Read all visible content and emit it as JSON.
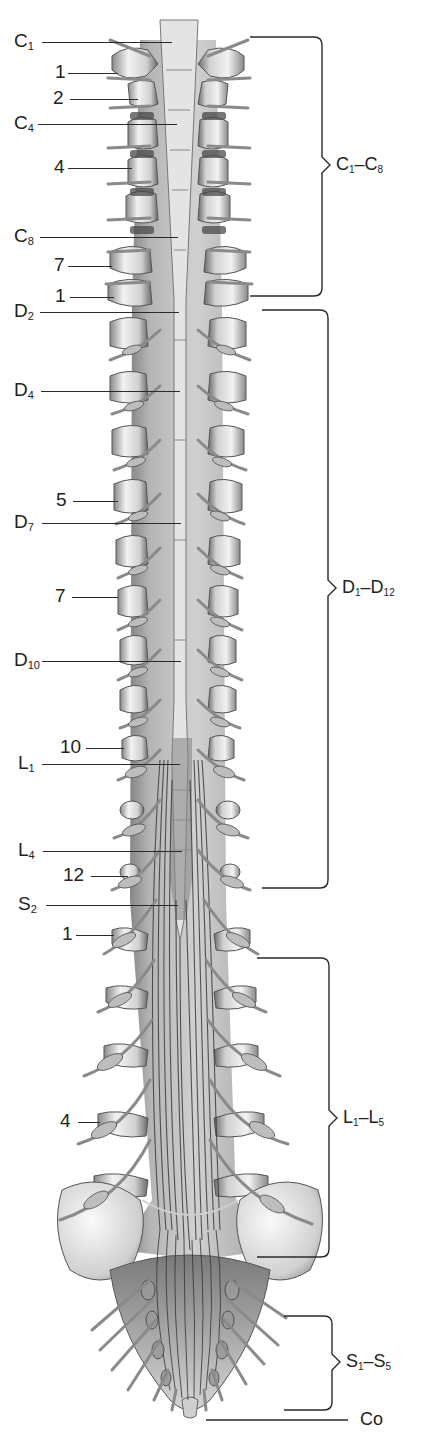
{
  "figure": {
    "left_labels": [
      {
        "id": "C1",
        "text": "C",
        "sub": "1",
        "y": 42,
        "x": 14,
        "line_x1": 42,
        "line_x2": 172
      },
      {
        "id": "v1",
        "text": "1",
        "sub": "",
        "y": 73,
        "x": 55,
        "line_x1": 68,
        "line_x2": 118
      },
      {
        "id": "v2",
        "text": "2",
        "sub": "",
        "y": 99,
        "x": 53,
        "line_x1": 70,
        "line_x2": 138
      },
      {
        "id": "C4",
        "text": "C",
        "sub": "4",
        "y": 124,
        "x": 14,
        "line_x1": 38,
        "line_x2": 177
      },
      {
        "id": "v4",
        "text": "4",
        "sub": "",
        "y": 168,
        "x": 54,
        "line_x1": 68,
        "line_x2": 132
      },
      {
        "id": "C8",
        "text": "C",
        "sub": "8",
        "y": 237,
        "x": 14,
        "line_x1": 40,
        "line_x2": 178
      },
      {
        "id": "v7a",
        "text": "7",
        "sub": "",
        "y": 266,
        "x": 54,
        "line_x1": 68,
        "line_x2": 112
      },
      {
        "id": "v1b",
        "text": "1",
        "sub": "",
        "y": 297,
        "x": 55,
        "line_x1": 70,
        "line_x2": 114
      },
      {
        "id": "D2",
        "text": "D",
        "sub": "2",
        "y": 312,
        "x": 14,
        "line_x1": 40,
        "line_x2": 179
      },
      {
        "id": "D4",
        "text": "D",
        "sub": "4",
        "y": 391,
        "x": 14,
        "line_x1": 41,
        "line_x2": 180
      },
      {
        "id": "v5",
        "text": "5",
        "sub": "",
        "y": 501,
        "x": 56,
        "line_x1": 73,
        "line_x2": 118
      },
      {
        "id": "D7",
        "text": "D",
        "sub": "7",
        "y": 523,
        "x": 14,
        "line_x1": 42,
        "line_x2": 181
      },
      {
        "id": "v7b",
        "text": "7",
        "sub": "",
        "y": 597,
        "x": 55,
        "line_x1": 72,
        "line_x2": 118
      },
      {
        "id": "D10",
        "text": "D",
        "sub": "10",
        "y": 661,
        "x": 14,
        "line_x1": 42,
        "line_x2": 181
      },
      {
        "id": "v10",
        "text": "10",
        "sub": "",
        "y": 748,
        "x": 60,
        "line_x1": 86,
        "line_x2": 124
      },
      {
        "id": "L1",
        "text": "L",
        "sub": "1",
        "y": 764,
        "x": 18,
        "line_x1": 42,
        "line_x2": 180
      },
      {
        "id": "L4",
        "text": "L",
        "sub": "4",
        "y": 851,
        "x": 18,
        "line_x1": 43,
        "line_x2": 182
      },
      {
        "id": "v12",
        "text": "12",
        "sub": "",
        "y": 876,
        "x": 63,
        "line_x1": 91,
        "line_x2": 128
      },
      {
        "id": "S2",
        "text": "S",
        "sub": "2",
        "y": 905,
        "x": 18,
        "line_x1": 46,
        "line_x2": 178
      },
      {
        "id": "v1c",
        "text": "1",
        "sub": "",
        "y": 935,
        "x": 62,
        "line_x1": 76,
        "line_x2": 114
      },
      {
        "id": "v4b",
        "text": "4",
        "sub": "",
        "y": 1122,
        "x": 60,
        "line_x1": 78,
        "line_x2": 100
      }
    ],
    "right_groups": [
      {
        "id": "cervical",
        "text_a": "C",
        "sub_a": "1",
        "dash": "–",
        "text_b": "C",
        "sub_b": "8",
        "top": 37,
        "bottom": 296,
        "mid": 165,
        "x_start": 250,
        "x_brace": 322
      },
      {
        "id": "thoracic",
        "text_a": "D",
        "sub_a": "1",
        "dash": "–",
        "text_b": "D",
        "sub_b": "12",
        "top": 310,
        "bottom": 888,
        "mid": 588,
        "x_start": 262,
        "x_brace": 328
      },
      {
        "id": "lumbar",
        "text_a": "L",
        "sub_a": "1",
        "dash": "–",
        "text_b": "L",
        "sub_b": "5",
        "top": 958,
        "bottom": 1257,
        "mid": 1118,
        "x_start": 257,
        "x_brace": 329
      },
      {
        "id": "sacral",
        "text_a": "S",
        "sub_a": "1",
        "dash": "–",
        "text_b": "S",
        "sub_b": "5",
        "top": 1316,
        "bottom": 1410,
        "mid": 1362,
        "x_start": 284,
        "x_brace": 332
      }
    ],
    "coccygeal": {
      "text": "Co",
      "y": 1420,
      "x_line1": 206,
      "x_line2": 348,
      "x_text": 360
    },
    "colors": {
      "ink": "#222222",
      "bone_light": "#ececec",
      "bone_mid": "#bdbdbd",
      "bone_dark": "#6e6e6e",
      "cord": "#dcdcdc",
      "nerve": "#9a9a9a",
      "cauda": "#3c3c3c"
    }
  }
}
